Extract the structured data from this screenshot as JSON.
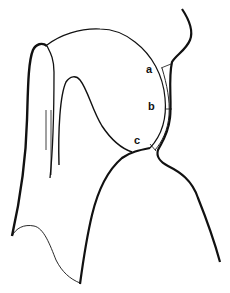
{
  "diagram": {
    "type": "line-drawing",
    "stroke_color": "#111111",
    "background": "#ffffff",
    "labels": [
      {
        "id": "a",
        "text": "a",
        "x": 146,
        "y": 64
      },
      {
        "id": "b",
        "text": "b",
        "x": 148,
        "y": 101
      },
      {
        "id": "c",
        "text": "c",
        "x": 134,
        "y": 135
      }
    ]
  }
}
